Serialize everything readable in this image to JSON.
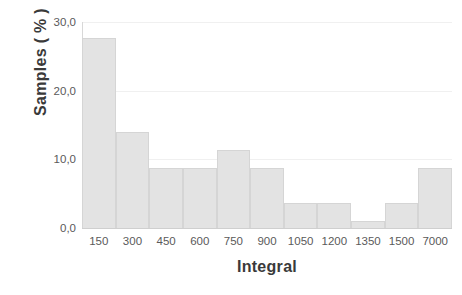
{
  "chart_data": {
    "type": "bar",
    "title": "",
    "subtitle": "",
    "xlabel": "Integral",
    "ylabel": "Samples ( % )",
    "categories": [
      "150",
      "300",
      "450",
      "600",
      "750",
      "900",
      "1050",
      "1200",
      "1350",
      "1500",
      "7000"
    ],
    "values": [
      27.6,
      14.0,
      8.8,
      8.8,
      11.3,
      8.8,
      3.6,
      3.6,
      1.0,
      3.6,
      8.8
    ],
    "ylim": [
      0.0,
      30.0
    ],
    "y_ticks": [
      0.0,
      10.0,
      20.0,
      30.0
    ],
    "y_tick_labels": [
      "0,0",
      "10,0",
      "20,0",
      "30,0"
    ],
    "grid": true,
    "legend": null,
    "legend_position": "none",
    "bar_fill_color": "#e3e3e3",
    "bar_border_color": "#d5d5d5",
    "gridline_color": "#f0f0f0",
    "axis_color": "#cfcfcf",
    "tick_label_color": "#5a5a5a",
    "axis_title_color": "#3a3a3a",
    "background_color": "#ffffff",
    "decimal_separator": ","
  }
}
